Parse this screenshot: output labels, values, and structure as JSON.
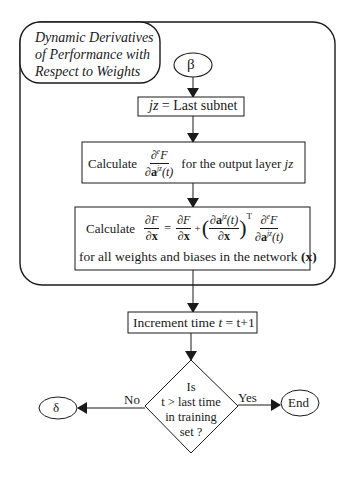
{
  "diagram": {
    "title": [
      "Dynamic Derivatives",
      "of Performance with",
      "Respect to Weights"
    ],
    "start_connector": "β",
    "steps": {
      "init": {
        "lhs": "jz",
        "op": "=",
        "rhs": "Last subnet"
      },
      "calc_output": {
        "prefix": "Calculate",
        "frac_num": "∂",
        "frac_num_sup": "e",
        "frac_num_var": "F",
        "frac_den": "∂a",
        "frac_den_sup": "jz",
        "frac_den_arg": "(t)",
        "suffix": "for the output layer",
        "suffix_var": "jz"
      },
      "calc_weights": {
        "prefix": "Calculate",
        "lhs_num": "∂F",
        "lhs_den": "∂x",
        "eq": "=",
        "t1_num": "∂F",
        "t1_den": "∂x",
        "plus": "+",
        "t2_num": "∂a",
        "t2_num_sup": "jz",
        "t2_num_arg": "(t)",
        "t2_den": "∂x",
        "t2_transpose": "T",
        "t3_num": "∂",
        "t3_num_sup": "e",
        "t3_num_var": "F",
        "t3_den": "∂a",
        "t3_den_sup": "jz",
        "t3_den_arg": "(t)",
        "line2": "for all weights and biases in the network",
        "line2_var": "(x)"
      },
      "increment": {
        "text": "Increment time",
        "var": "t",
        "expr": "= t+1"
      }
    },
    "decision": {
      "lines": [
        "Is",
        "t > last time",
        "in training",
        "set ?"
      ],
      "no_label": "No",
      "yes_label": "Yes"
    },
    "no_connector": "δ",
    "end_terminal": "End"
  },
  "colors": {
    "stroke": "#1a1a1a",
    "background": "#ffffff"
  }
}
